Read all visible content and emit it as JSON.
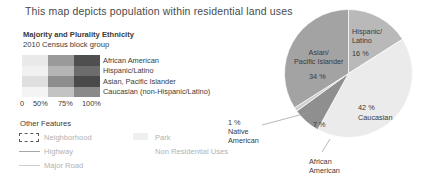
{
  "title": "This map depicts population within residential land uses",
  "legend": {
    "heading": "Majority and Plurality Ethnicity",
    "subheading": "2010 Census block group",
    "ethnicities": [
      {
        "label": "African American",
        "ramp": [
          "#e9e9e9",
          "#9a9a9a",
          "#4f4f4f"
        ]
      },
      {
        "label": "Hispanic/Latino",
        "ramp": [
          "#f1f1f1",
          "#b4b4b4",
          "#6d6d6d"
        ]
      },
      {
        "label": "Asian, Pacific Islander",
        "ramp": [
          "#dfdfdf",
          "#8d8d8d",
          "#4a4a4a"
        ]
      },
      {
        "label": "Caucasian (non-Hispanic/Latino)",
        "ramp": [
          "#f4f4f4",
          "#c3c3c3",
          "#8a8a8a"
        ]
      }
    ],
    "scale_ticks": [
      "0",
      "50%",
      "75%",
      "100%"
    ]
  },
  "other_features": {
    "heading": "Other Features",
    "items": [
      {
        "label": "Neighborhood",
        "icon": "dashed-rectangle-icon"
      },
      {
        "label": "Highway",
        "icon": "solid-line-icon"
      },
      {
        "label": "Major Road",
        "icon": "light-line-icon"
      },
      {
        "label": "Park",
        "icon": "filled-swatch-icon"
      },
      {
        "label": "Non Residential Uses",
        "icon": "no-icon"
      }
    ]
  },
  "chart_data": {
    "type": "pie",
    "title": "",
    "legend_position": "inline-labels",
    "start_angle_deg": 0,
    "direction": "clockwise",
    "categories": [
      "Hispanic/Latino",
      "Caucasian",
      "African American",
      "Native American",
      "Asian/Pacific Islander"
    ],
    "values": [
      16,
      42,
      7,
      1,
      34
    ],
    "unit": "%",
    "colors": [
      "#b9b9b9",
      "#ebebeb",
      "#8f8f8f",
      "#cfcfcf",
      "#a3a3a3"
    ],
    "labels": {
      "hispanic_name": "Hispanic/\nLatino",
      "hispanic_name_l1": "Hispanic/",
      "hispanic_name_l2": "Latino",
      "hispanic_pct": "16 %",
      "asian_name_l1": "Asian/",
      "asian_name_l2": "Pacific Islander",
      "asian_pct": "34 %",
      "caucasian_pct": "42 %",
      "caucasian_name": "Caucasian",
      "african_name_l1": "African",
      "african_name_l2": "American",
      "african_pct": "7 %",
      "native_pct": "1 %",
      "native_name_l1": "Native",
      "native_name_l2": "American"
    }
  }
}
